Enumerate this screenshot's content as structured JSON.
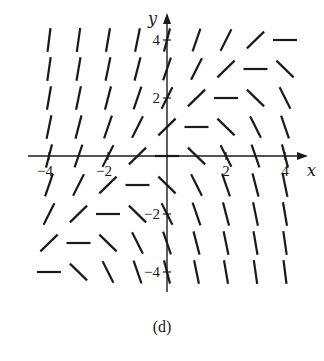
{
  "figure": {
    "caption": "(d)",
    "type": "slope-field",
    "x_axis_label": "x",
    "y_axis_label": "y",
    "x_ticks": [
      {
        "value": -4,
        "label": "−4"
      },
      {
        "value": -2,
        "label": "−2"
      },
      {
        "value": 2,
        "label": "2"
      },
      {
        "value": 4,
        "label": "4"
      }
    ],
    "y_ticks": [
      {
        "value": 4,
        "label": "4"
      },
      {
        "value": 2,
        "label": "2"
      },
      {
        "value": -2,
        "label": "−2"
      },
      {
        "value": -4,
        "label": "−4"
      }
    ],
    "xlim": [
      -4,
      4
    ],
    "ylim": [
      -4,
      4
    ],
    "grid_points": {
      "x": [
        -4,
        -3,
        -2,
        -1,
        0,
        1,
        2,
        3,
        4
      ],
      "y": [
        -4,
        -3,
        -2,
        -1,
        0,
        1,
        2,
        3,
        4
      ]
    },
    "slope_function": "y - x",
    "colors": {
      "ink": "#1a1a1a",
      "background": "#ffffff"
    }
  },
  "chart_data": {
    "type": "slope-field",
    "title": "(d)",
    "xlabel": "x",
    "ylabel": "y",
    "xlim": [
      -4,
      4
    ],
    "ylim": [
      -4,
      4
    ],
    "x_tick_labels": [
      "−4",
      "−2",
      "2",
      "4"
    ],
    "y_tick_labels": [
      "−4",
      "−2",
      "2",
      "4"
    ],
    "grid": false,
    "equation": "dy/dx = y − x",
    "note": "Segments are horizontal along the line y = x, steep positive above-left, steep negative below-right."
  }
}
